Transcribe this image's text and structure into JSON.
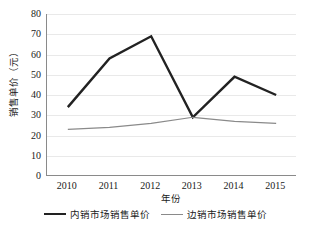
{
  "chart_data": {
    "type": "line",
    "title": "",
    "xlabel": "年份",
    "ylabel": "销售单价（元）",
    "categories": [
      "2010",
      "2011",
      "2012",
      "2013",
      "2014",
      "2015"
    ],
    "yticks": [
      "80",
      "70",
      "60",
      "50",
      "40",
      "30",
      "20",
      "10",
      "0"
    ],
    "ylim": [
      0,
      80
    ],
    "ystep": 10,
    "grid": true,
    "legend_position": "bottom",
    "series": [
      {
        "name": "内销市场销售单价",
        "values": [
          34,
          58,
          69,
          29,
          49,
          40
        ],
        "color": "#222222",
        "width": 2.4
      },
      {
        "name": "边销市场销售单价",
        "values": [
          23,
          24,
          26,
          29,
          27,
          26
        ],
        "color": "#8a8a8a",
        "width": 1.2
      }
    ]
  }
}
